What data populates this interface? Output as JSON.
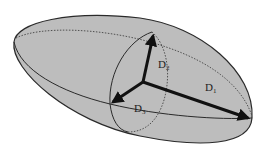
{
  "diagram": {
    "shape": "ellipsoid",
    "fill_color": "#bdbdbd",
    "outline_color": "#2a2a2a",
    "arrow_color": "#111111",
    "axes": [
      {
        "id": "D1",
        "base": "D",
        "subscript": "1",
        "description": "major axis"
      },
      {
        "id": "D2",
        "base": "D",
        "subscript": "2",
        "description": "second axis"
      },
      {
        "id": "D3",
        "base": "D",
        "subscript": "3",
        "description": "third axis"
      }
    ]
  }
}
